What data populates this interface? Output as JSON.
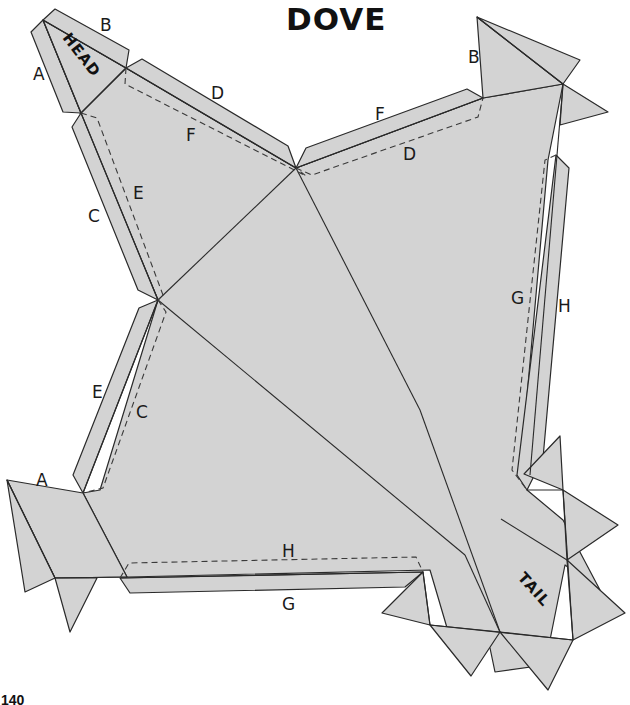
{
  "title": "DOVE",
  "page_number": "140",
  "pattern": {
    "fill_color": "#d3d3d3",
    "line_color": "#2a2a2a",
    "sections": {
      "head": "HEAD",
      "tail": "TAIL"
    },
    "edge_labels": {
      "a_head": "A",
      "b_head": "B",
      "d_top_left": "D",
      "f_top_left": "F",
      "c_left_upper": "C",
      "e_left_upper": "E",
      "b_top_right": "B",
      "f_top_right": "F",
      "d_top_right": "D",
      "g_right": "G",
      "h_right": "H",
      "e_left_lower": "E",
      "c_left_lower": "C",
      "a_left_lower": "A",
      "h_bottom": "H",
      "g_bottom": "G"
    }
  }
}
